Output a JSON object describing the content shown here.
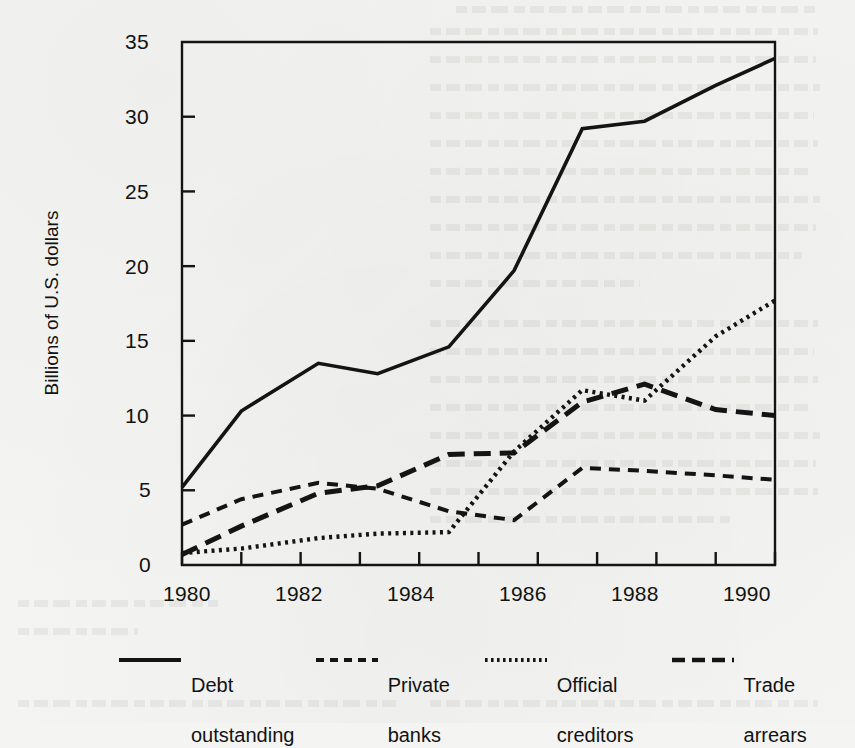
{
  "chart_data": {
    "type": "line",
    "title": "",
    "xlabel": "",
    "ylabel": "Billions of U.S. dollars",
    "xlim": [
      1980,
      1990
    ],
    "ylim": [
      0,
      35
    ],
    "xticks": [
      1980,
      1982,
      1984,
      1986,
      1988,
      1990
    ],
    "xtick_labels": [
      "1980",
      "1982",
      "1984",
      "1986",
      "1988",
      "1990"
    ],
    "xminor_ticks": [
      1981,
      1983,
      1985,
      1987,
      1989
    ],
    "yticks": [
      0,
      5,
      10,
      15,
      20,
      25,
      30,
      35
    ],
    "ytick_labels": [
      "0",
      "5",
      "10",
      "15",
      "20",
      "25",
      "30",
      "35"
    ],
    "grid": false,
    "legend_position": "below",
    "series": [
      {
        "name": "Debt\noutstanding",
        "label_line1": "Debt",
        "label_line2": "outstanding",
        "style": "solid",
        "color": "#141414",
        "x": [
          1980.0,
          1981.0,
          1982.3,
          1983.3,
          1984.5,
          1985.6,
          1986.75,
          1987.8,
          1989.0,
          1990.0
        ],
        "y": [
          5.2,
          10.3,
          13.5,
          12.8,
          14.6,
          19.7,
          29.2,
          29.7,
          32.1,
          33.9
        ]
      },
      {
        "name": "Private\nbanks",
        "label_line1": "Private",
        "label_line2": "banks",
        "style": "dashed",
        "color": "#141414",
        "x": [
          1980.0,
          1981.0,
          1982.3,
          1983.3,
          1984.5,
          1985.6,
          1986.75,
          1987.8,
          1989.0,
          1990.0
        ],
        "y": [
          2.7,
          4.4,
          5.5,
          5.1,
          3.6,
          3.0,
          6.5,
          6.3,
          6.0,
          5.7
        ]
      },
      {
        "name": "Official\ncreditors",
        "label_line1": "Official",
        "label_line2": "creditors",
        "style": "dotted",
        "color": "#141414",
        "x": [
          1980.0,
          1981.0,
          1982.3,
          1983.3,
          1984.5,
          1985.6,
          1986.75,
          1987.8,
          1989.0,
          1990.0
        ],
        "y": [
          0.8,
          1.1,
          1.8,
          2.1,
          2.2,
          7.6,
          11.7,
          11.0,
          15.3,
          17.7
        ]
      },
      {
        "name": "Trade\narrears",
        "label_line1": "Trade",
        "label_line2": "arrears",
        "style": "longdash",
        "color": "#141414",
        "x": [
          1980.0,
          1981.0,
          1982.3,
          1983.3,
          1984.5,
          1985.6,
          1986.75,
          1987.8,
          1989.0,
          1990.0
        ],
        "y": [
          0.7,
          2.6,
          4.8,
          5.3,
          7.4,
          7.5,
          10.9,
          12.1,
          10.4,
          10.0
        ]
      }
    ]
  },
  "legend": {
    "entries": [
      {
        "label_line1": "Debt",
        "label_line2": "outstanding",
        "style": "solid"
      },
      {
        "label_line1": "Private",
        "label_line2": "banks",
        "style": "dashed"
      },
      {
        "label_line1": "Official",
        "label_line2": "creditors",
        "style": "dotted"
      },
      {
        "label_line1": "Trade",
        "label_line2": "arrears",
        "style": "longdash"
      }
    ]
  },
  "colors": {
    "ink": "#141414",
    "paper": "#f4f4f2"
  }
}
